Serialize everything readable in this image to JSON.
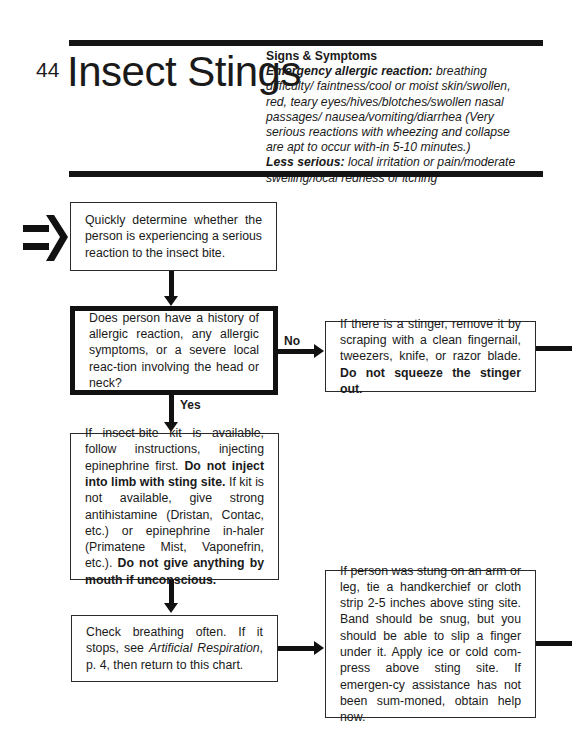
{
  "header": {
    "page_number": "44",
    "title": "Insect Stings",
    "symptoms": {
      "heading": "Signs & Symptoms",
      "emergency_label": "Emergency allergic reaction:",
      "emergency_text": " breathing difficulty/ faintness/cool or moist skin/swollen, red, teary eyes/hives/blotches/swollen nasal passages/ nausea/vomiting/diarrhea (Very serious reactions with wheezing and collapse are apt to occur with-in 5-10 minutes.)",
      "less_label": "Less serious:",
      "less_text": " local irritation or pain/moderate swelling/local redness or itching"
    }
  },
  "flowchart": {
    "start_box": {
      "text": "Quickly determine whether the person is experiencing a serious reaction to the insect bite."
    },
    "decision_box": {
      "text": "Does person have a history of allergic reaction, any allergic symptoms, or a severe local reac-tion involving the head or neck?"
    },
    "no_label": "No",
    "yes_label": "Yes",
    "stinger_box": {
      "text": "If there is a stinger, remove it by scraping with a clean fingernail, tweezers, knife, or razor blade. ",
      "bold": "Do not squeeze the stinger out."
    },
    "kit_box": {
      "t1": "If insect-bite kit is available, follow instructions, injecting epinephrine first. ",
      "b1": "Do not inject into limb with sting site.",
      "t2": " If kit is not available, give strong antihistamine (Dristan, Contac, etc.) or epinephrine in-haler (Primatene Mist, Vaponefrin, etc.). ",
      "b2": "Do not give anything by mouth if unconscious."
    },
    "breathing_box": {
      "t1": "Check breathing often. If it stops, see ",
      "italic": "Artificial Respiration",
      "t2": ", p. 4, then return to this chart."
    },
    "limb_box": {
      "text": "If person was stung on an arm or leg, tie a handkerchief or cloth strip 2-5 inches above sting site. Band should be snug, but you should be able to slip a finger under it. Apply ice or cold com-press above sting site. If emergen-cy assistance has not been sum-moned, obtain help now."
    }
  }
}
